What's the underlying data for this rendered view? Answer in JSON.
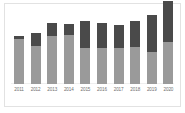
{
  "chart_data": {
    "type": "bar",
    "subtype": "stacked-vertical",
    "title": "",
    "subtitle": "",
    "xlabel": "",
    "ylabel": "",
    "grid": false,
    "legend": "none",
    "axis_visible": false,
    "categories": [
      "2011",
      "2012",
      "2013",
      "2014",
      "2015",
      "2016",
      "2017",
      "2018",
      "2019",
      "2020"
    ],
    "ylim": [
      0,
      100
    ],
    "series": [
      {
        "name": "lower-segment",
        "color": "#9a9a9a",
        "values": [
          62,
          53,
          67,
          68,
          50,
          50,
          50,
          52,
          45,
          58
        ]
      },
      {
        "name": "upper-segment",
        "color": "#4a4a4a",
        "values": [
          5,
          18,
          18,
          15,
          38,
          35,
          32,
          35,
          51,
          57
        ]
      }
    ],
    "totals": [
      67,
      71,
      85,
      83,
      88,
      85,
      82,
      87,
      96,
      115
    ]
  },
  "colors": {
    "background": "#ffffff",
    "frame_border": "#e2e2e2",
    "segment_lower": "#9a9a9a",
    "segment_upper": "#4a4a4a",
    "tick_label": "#6f6f6f"
  },
  "axis": {
    "tick_labels": [
      "2011",
      "2012",
      "2013",
      "2014",
      "2015",
      "2016",
      "2017",
      "2018",
      "2019",
      "2020"
    ]
  }
}
